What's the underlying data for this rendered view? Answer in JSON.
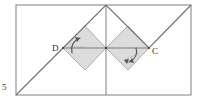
{
  "figure": {
    "type": "geometry-diagram",
    "page_number": "5",
    "labels": {
      "left_vertex": "D",
      "right_vertex": "C"
    },
    "colors": {
      "outline": "#8a8a8a",
      "diagonal": "#6e6e6e",
      "shading": "#dcdcdc",
      "shading_edge": "#9a9a9a",
      "arrow": "#555555",
      "text": "#2b2b2b",
      "background": "#ffffff"
    },
    "geometry": {
      "rectangle": {
        "x": 16,
        "y": 5,
        "width": 175,
        "height": 90
      },
      "interior_vertical": {
        "x": 106,
        "y1": 5,
        "y2": 95
      },
      "zigzag_points": "16,95 63,48 106,5 149,48 191,5",
      "left_diamond_points": "63,48 85,26 106,48 85,70",
      "right_diamond_points": "106,48 128,26 149,48 128,70",
      "horizontal_axis": {
        "x1": 63,
        "y1": 48,
        "x2": 149,
        "y2": 48
      },
      "point_D": {
        "x": 63,
        "y": 48
      },
      "point_C": {
        "x": 149,
        "y": 48
      },
      "arrow_left": {
        "cx": 80,
        "cy": 44,
        "direction": "counterclockwise"
      },
      "arrow_right": {
        "cx": 130,
        "cy": 55,
        "direction": "clockwise"
      }
    }
  }
}
